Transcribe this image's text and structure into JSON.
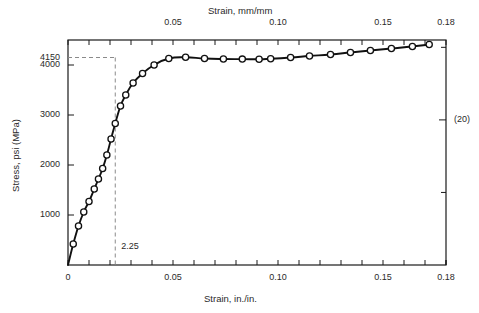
{
  "chart_data": {
    "type": "line",
    "title": "",
    "xlabel": "Strain, in./in.",
    "xlabel_top": "Strain, mm/mm",
    "ylabel": "Stress, psi (MPa)",
    "xlim": [
      0,
      0.18
    ],
    "ylim": [
      0,
      4500
    ],
    "ylim_mpa": [
      0,
      31.03
    ],
    "grid": false,
    "legend": null,
    "x_ticks_bottom": [
      "0",
      "0.05",
      "0.10",
      "0.15",
      "0.18"
    ],
    "x_tick_values_bottom": [
      0,
      0.05,
      0.1,
      0.15,
      0.18
    ],
    "x_ticks_top": [
      "0.05",
      "0.10",
      "0.15",
      "0.18"
    ],
    "x_tick_values_top": [
      0.05,
      0.1,
      0.15,
      0.18
    ],
    "y_ticks_left": [
      "1000",
      "2000",
      "3000",
      "4000",
      "4150"
    ],
    "y_tick_values_left": [
      1000,
      2000,
      3000,
      4000,
      4150
    ],
    "y_ticks_right": [
      "(20)",
      "(40)",
      "(60)"
    ],
    "y_tick_values_right_psi": [
      2900,
      5800,
      8700
    ],
    "x_minor_interval": 0.01,
    "annotations": [
      {
        "label": "2.25",
        "x": 0.0225,
        "y": 4150,
        "note": "offset yield point marked by dashed construction lines"
      }
    ],
    "dashed_guides": {
      "horizontal_y": 4150,
      "vertical_x": 0.0225
    },
    "series": [
      {
        "name": "stress-strain curve",
        "marker": "open-circle",
        "x": [
          0.0,
          0.0025,
          0.005,
          0.0075,
          0.01,
          0.0125,
          0.0145,
          0.0165,
          0.0185,
          0.0205,
          0.0225,
          0.025,
          0.0275,
          0.031,
          0.0355,
          0.041,
          0.048,
          0.056,
          0.065,
          0.074,
          0.083,
          0.091,
          0.0965,
          0.106,
          0.115,
          0.125,
          0.1345,
          0.144,
          0.154,
          0.164,
          0.172
        ],
        "y": [
          0,
          420,
          780,
          1060,
          1270,
          1520,
          1720,
          1930,
          2200,
          2520,
          2830,
          3180,
          3400,
          3640,
          3830,
          4000,
          4130,
          4155,
          4130,
          4120,
          4118,
          4115,
          4125,
          4150,
          4180,
          4210,
          4250,
          4290,
          4330,
          4370,
          4410
        ]
      }
    ]
  },
  "axes": {
    "top_title": "Strain, mm/mm",
    "bottom_title": "Strain, in./in.",
    "left_title": "Stress, psi (MPa)"
  },
  "colors": {
    "curve": "#111111",
    "marker_fill": "#ffffff",
    "frame": "#1a1a1a",
    "dashed": "#8a8a8a",
    "text": "#2a2a2a",
    "background": "#ffffff"
  }
}
